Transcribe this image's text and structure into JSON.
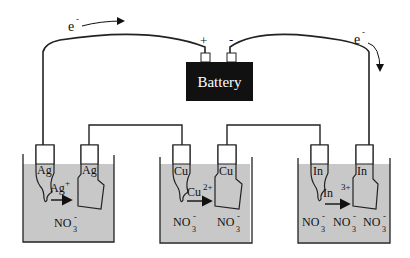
{
  "battery": {
    "label": "Battery",
    "positive_terminal": "+",
    "negative_terminal": "-",
    "color": "#111111"
  },
  "electron_flow": {
    "left_label": "e",
    "left_sup": "-",
    "right_label": "e",
    "right_sup": "-"
  },
  "solution_color": "#c8c8c8",
  "cells": [
    {
      "anode_label": "Ag",
      "cathode_label": "Ag",
      "ion_label": "Ag",
      "ion_charge": "+",
      "anions": [
        {
          "text": "NO",
          "sub": "3",
          "sup": "-"
        }
      ]
    },
    {
      "anode_label": "Cu",
      "cathode_label": "Cu",
      "ion_label": "Cu",
      "ion_charge": "2+",
      "anions": [
        {
          "text": "NO",
          "sub": "3",
          "sup": "-"
        },
        {
          "text": "NO",
          "sub": "3",
          "sup": "-"
        }
      ]
    },
    {
      "anode_label": "In",
      "cathode_label": "In",
      "ion_label": "In",
      "ion_charge": "3+",
      "anions": [
        {
          "text": "NO",
          "sub": "3",
          "sup": "-"
        },
        {
          "text": "NO",
          "sub": "3",
          "sup": "-"
        },
        {
          "text": "NO",
          "sub": "3",
          "sup": "-"
        }
      ]
    }
  ]
}
